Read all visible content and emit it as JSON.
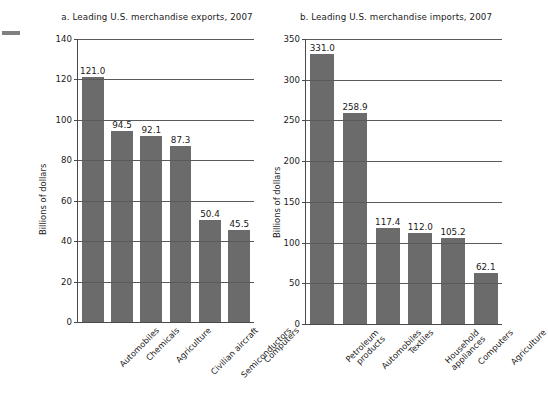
{
  "figure": {
    "edge_mark": "crop-mark",
    "background": "#ffffff",
    "bar_color": "#6b6b6b",
    "axis_color": "#4a4a4a"
  },
  "chart_data": [
    {
      "type": "bar",
      "id": "panel-a",
      "title": "a. Leading U.S. merchandise exports, 2007",
      "xlabel": "",
      "ylabel": "Billions of dollars",
      "ylim": [
        0,
        140
      ],
      "yticks": [
        0,
        20,
        40,
        60,
        80,
        100,
        120,
        140
      ],
      "ytick_labels": [
        "0",
        "20",
        "40",
        "60",
        "80",
        "100",
        "120",
        "140"
      ],
      "grid": true,
      "legend": "none",
      "categories": [
        "Automobiles",
        "Chemicals",
        "Agriculture",
        "Civilian aircraft",
        "Semiconductors",
        "Computers"
      ],
      "values": [
        121.0,
        94.5,
        92.1,
        87.3,
        50.4,
        45.5
      ],
      "value_labels": [
        "121.0",
        "94.5",
        "92.1",
        "87.3",
        "50.4",
        "45.5"
      ]
    },
    {
      "type": "bar",
      "id": "panel-b",
      "title": "b. Leading U.S. merchandise imports, 2007",
      "xlabel": "",
      "ylabel": "Billions of dollars",
      "ylim": [
        0,
        350
      ],
      "yticks": [
        0,
        50,
        100,
        150,
        200,
        250,
        300,
        350
      ],
      "ytick_labels": [
        "0",
        "50",
        "100",
        "150",
        "200",
        "250",
        "300",
        "350"
      ],
      "grid": true,
      "legend": "none",
      "categories": [
        "Petroleum\nproducts",
        "Automobiles",
        "Textiles",
        "Household\nappliances",
        "Computers",
        "Agriculture"
      ],
      "values": [
        331.0,
        258.9,
        117.4,
        112.0,
        105.2,
        62.1
      ],
      "value_labels": [
        "331.0",
        "258.9",
        "117.4",
        "112.0",
        "105.2",
        "62.1"
      ]
    }
  ]
}
